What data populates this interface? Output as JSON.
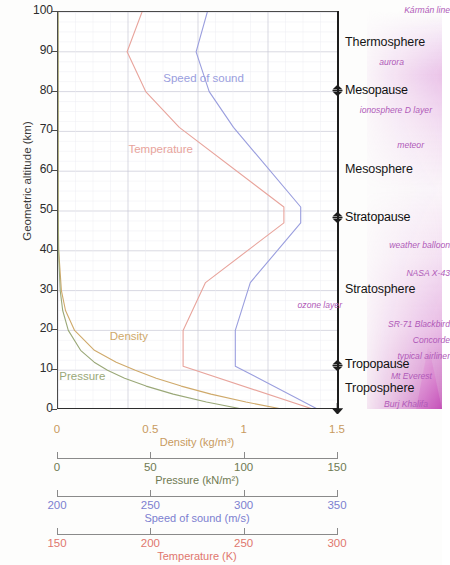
{
  "chart_data": {
    "type": "line",
    "title": "",
    "ylabel": "Geometric altitude (km)",
    "ylim": [
      0,
      100
    ],
    "yticks": [
      0,
      10,
      20,
      30,
      40,
      50,
      60,
      70,
      80,
      90,
      100
    ],
    "grid": true,
    "legend": "inline-labels",
    "x_axes": [
      {
        "name": "Density",
        "label": "Density (kg/m³)",
        "unit": "kg/m³",
        "color": "#c89a5e",
        "range": [
          0,
          1.5
        ],
        "ticks": [
          0,
          0.5,
          1,
          1.5
        ],
        "tick_labels": [
          "0",
          "0.5",
          "1",
          "1.5"
        ]
      },
      {
        "name": "Pressure",
        "label": "Pressure (kN/m²)",
        "unit": "kN/m²",
        "color": "#6f7a52",
        "range": [
          0,
          150
        ],
        "ticks": [
          0,
          50,
          100,
          150
        ],
        "tick_labels": [
          "0",
          "50",
          "100",
          "150"
        ]
      },
      {
        "name": "Speed of sound",
        "label": "Speed of sound (m/s)",
        "unit": "m/s",
        "color": "#7c7fd0",
        "range": [
          200,
          350
        ],
        "ticks": [
          200,
          250,
          300,
          350
        ],
        "tick_labels": [
          "200",
          "250",
          "300",
          "350"
        ]
      },
      {
        "name": "Temperature",
        "label": "Temperature (K)",
        "unit": "K",
        "color": "#e0776e",
        "range": [
          150,
          300
        ],
        "ticks": [
          150,
          200,
          250,
          300
        ],
        "tick_labels": [
          "150",
          "200",
          "250",
          "300"
        ]
      }
    ],
    "series": [
      {
        "name": "Temperature",
        "label": "Temperature",
        "color": "#e8a49c",
        "axis": "Temperature",
        "unit": "K",
        "label_position": {
          "altitude_km": 65,
          "value_K": 205
        },
        "points": [
          {
            "altitude_km": 0,
            "value_K": 288
          },
          {
            "altitude_km": 11,
            "value_K": 217
          },
          {
            "altitude_km": 20,
            "value_K": 217
          },
          {
            "altitude_km": 32,
            "value_K": 229
          },
          {
            "altitude_km": 47,
            "value_K": 271
          },
          {
            "altitude_km": 51,
            "value_K": 271
          },
          {
            "altitude_km": 71,
            "value_K": 215
          },
          {
            "altitude_km": 80,
            "value_K": 197
          },
          {
            "altitude_km": 90,
            "value_K": 187
          },
          {
            "altitude_km": 100,
            "value_K": 195
          }
        ]
      },
      {
        "name": "Speed of sound",
        "label": "Speed of sound",
        "color": "#9a9ede",
        "axis": "Speed of sound",
        "unit": "m/s",
        "label_position": {
          "altitude_km": 83,
          "value_ms": 278
        },
        "points": [
          {
            "altitude_km": 0,
            "value_ms": 340
          },
          {
            "altitude_km": 11,
            "value_ms": 295
          },
          {
            "altitude_km": 20,
            "value_ms": 295
          },
          {
            "altitude_km": 32,
            "value_ms": 303
          },
          {
            "altitude_km": 47,
            "value_ms": 330
          },
          {
            "altitude_km": 51,
            "value_ms": 330
          },
          {
            "altitude_km": 71,
            "value_ms": 294
          },
          {
            "altitude_km": 80,
            "value_ms": 281
          },
          {
            "altitude_km": 90,
            "value_ms": 274
          },
          {
            "altitude_km": 100,
            "value_ms": 280
          }
        ]
      },
      {
        "name": "Density",
        "label": "Density",
        "color": "#cfa96a",
        "axis": "Density",
        "unit": "kg/m³",
        "label_position": {
          "altitude_km": 18,
          "value_kgm3": 0.38
        },
        "points": [
          {
            "altitude_km": 0,
            "value_kgm3": 1.225
          },
          {
            "altitude_km": 2,
            "value_kgm3": 1.007
          },
          {
            "altitude_km": 4,
            "value_kgm3": 0.819
          },
          {
            "altitude_km": 6,
            "value_kgm3": 0.66
          },
          {
            "altitude_km": 8,
            "value_kgm3": 0.526
          },
          {
            "altitude_km": 10,
            "value_kgm3": 0.414
          },
          {
            "altitude_km": 12,
            "value_kgm3": 0.312
          },
          {
            "altitude_km": 15,
            "value_kgm3": 0.195
          },
          {
            "altitude_km": 20,
            "value_kgm3": 0.089
          },
          {
            "altitude_km": 25,
            "value_kgm3": 0.04
          },
          {
            "altitude_km": 30,
            "value_kgm3": 0.018
          },
          {
            "altitude_km": 40,
            "value_kgm3": 0.004
          },
          {
            "altitude_km": 50,
            "value_kgm3": 0.001
          },
          {
            "altitude_km": 100,
            "value_kgm3": 0.0
          }
        ]
      },
      {
        "name": "Pressure",
        "label": "Pressure",
        "color": "#9aa878",
        "axis": "Pressure",
        "unit": "kN/m²",
        "label_position": {
          "altitude_km": 8,
          "value_kNm2": 13
        },
        "points": [
          {
            "altitude_km": 0,
            "value_kNm2": 101.3
          },
          {
            "altitude_km": 2,
            "value_kNm2": 79.5
          },
          {
            "altitude_km": 4,
            "value_kNm2": 61.7
          },
          {
            "altitude_km": 6,
            "value_kNm2": 47.2
          },
          {
            "altitude_km": 8,
            "value_kNm2": 35.7
          },
          {
            "altitude_km": 10,
            "value_kNm2": 26.5
          },
          {
            "altitude_km": 12,
            "value_kNm2": 19.4
          },
          {
            "altitude_km": 15,
            "value_kNm2": 12.1
          },
          {
            "altitude_km": 20,
            "value_kNm2": 5.5
          },
          {
            "altitude_km": 25,
            "value_kNm2": 2.5
          },
          {
            "altitude_km": 30,
            "value_kNm2": 1.2
          },
          {
            "altitude_km": 40,
            "value_kNm2": 0.29
          },
          {
            "altitude_km": 50,
            "value_kNm2": 0.08
          },
          {
            "altitude_km": 100,
            "value_kNm2": 0.0
          }
        ]
      }
    ],
    "layers": [
      {
        "name": "Thermosphere",
        "altitude_km": 92,
        "type": "layer"
      },
      {
        "name": "Mesopause",
        "altitude_km": 80,
        "type": "boundary"
      },
      {
        "name": "Mesosphere",
        "altitude_km": 60,
        "type": "layer"
      },
      {
        "name": "Stratopause",
        "altitude_km": 48,
        "type": "boundary"
      },
      {
        "name": "Stratosphere",
        "altitude_km": 30,
        "type": "layer"
      },
      {
        "name": "Tropopause",
        "altitude_km": 11,
        "type": "boundary"
      },
      {
        "name": "Troposphere",
        "altitude_km": 5,
        "type": "layer"
      }
    ],
    "annotations": [
      {
        "text": "Kármán line",
        "altitude_km": 100
      },
      {
        "text": "aurora",
        "altitude_km": 87
      },
      {
        "text": "ionosphere D layer",
        "altitude_km": 75
      },
      {
        "text": "meteor",
        "altitude_km": 66
      },
      {
        "text": "weather balloon",
        "altitude_km": 41
      },
      {
        "text": "NASA X-43",
        "altitude_km": 34
      },
      {
        "text": "ozone layer",
        "altitude_km": 26
      },
      {
        "text": "SR-71 Blackbird",
        "altitude_km": 21
      },
      {
        "text": "Concorde",
        "altitude_km": 17
      },
      {
        "text": "typical airliner",
        "altitude_km": 13
      },
      {
        "text": "Mt Everest",
        "altitude_km": 8
      },
      {
        "text": "Burj Khalifa",
        "altitude_km": 1
      }
    ]
  }
}
